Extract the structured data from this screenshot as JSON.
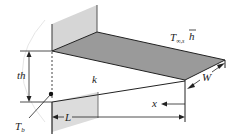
{
  "diagram": {
    "labels": {
      "ambient": "T",
      "ambient_sub": "∞,s",
      "h_bar": "h",
      "thickness": "th",
      "conductivity": "k",
      "width": "W",
      "position": "x",
      "length": "L",
      "base_temp": "T",
      "base_temp_sub": "b"
    },
    "colors": {
      "fin_top": "#9a9a9a",
      "fin_front": "#d8d8d8",
      "wall": "#d4d4d4",
      "line": "#222222"
    }
  }
}
